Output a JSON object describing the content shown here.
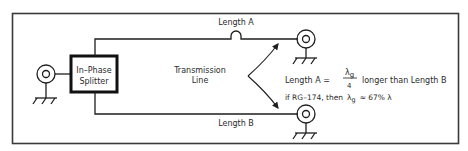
{
  "diagram": {
    "splitter": {
      "line1": "In–Phase",
      "line2": "Splitter"
    },
    "length_a": "Length A",
    "length_b": "Length B",
    "transmission_line": {
      "line1": "Transmission",
      "line2": "Line"
    },
    "formula": {
      "prefix": "Length A  =",
      "numerator": "λg",
      "numerator_symbol": "λ",
      "numerator_sub": "g",
      "denominator": "4",
      "suffix": "longer than Length B"
    },
    "note": {
      "prefix": "if RG–174,  then",
      "lambda": "λ",
      "sub": "g",
      "suffix": "≈ 67% λ"
    },
    "components": [
      "input-connector",
      "in-phase-splitter",
      "output-connector-a",
      "output-connector-b"
    ],
    "colors": {
      "line": "#1e1e1e",
      "border": "#3a3a3a",
      "background": "#ffffff"
    }
  }
}
